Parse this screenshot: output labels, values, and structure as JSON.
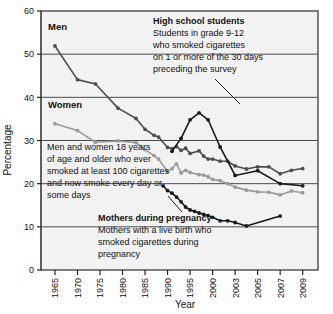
{
  "chart_data": {
    "type": "line",
    "title": "",
    "xlabel": "Year",
    "ylabel": "Percentage",
    "ylim": [
      0,
      60
    ],
    "yticks": [
      0,
      10,
      20,
      30,
      40,
      50,
      60
    ],
    "ytick_labels": [
      "0",
      "10",
      "20",
      "30",
      "40",
      "50",
      "60"
    ],
    "grid": "horizontal",
    "legend": "inline-annotations",
    "xtick_labels": [
      "1965",
      "1970",
      "1975",
      "1980",
      "1985",
      "1990",
      "1995",
      "2000",
      "2003",
      "2005",
      "2007",
      "2009"
    ],
    "xtick_values": [
      1965,
      1970,
      1975,
      1980,
      1985,
      1990,
      1995,
      2000,
      2003,
      2005,
      2007,
      2009
    ],
    "x_axis_note": "Tick spacing is uneven after 2000: 2000, 2003, 2005, 2007, 2009 are evenly spaced slots",
    "series": [
      {
        "name": "Men",
        "color": "#4d4d4d",
        "marker": "circle",
        "x": [
          1965,
          1970,
          1974,
          1979,
          1983,
          1985,
          1987,
          1988,
          1990,
          1991,
          1992,
          1993,
          1994,
          1995,
          1997,
          1998,
          1999,
          2000,
          2001,
          2002,
          2003,
          2004,
          2005,
          2006,
          2007,
          2008,
          2009
        ],
        "values": [
          51.9,
          44.1,
          43.1,
          37.5,
          35.1,
          32.6,
          31.2,
          30.8,
          28.4,
          28.1,
          28.6,
          27.7,
          28.2,
          27.0,
          27.6,
          26.4,
          25.7,
          25.7,
          25.2,
          25.2,
          24.1,
          23.4,
          23.9,
          23.9,
          22.3,
          23.1,
          23.5
        ]
      },
      {
        "name": "Women",
        "color": "#9a9a9a",
        "marker": "circle",
        "x": [
          1965,
          1970,
          1974,
          1979,
          1983,
          1985,
          1987,
          1988,
          1990,
          1991,
          1992,
          1993,
          1994,
          1995,
          1997,
          1998,
          1999,
          2000,
          2001,
          2002,
          2003,
          2004,
          2005,
          2006,
          2007,
          2008,
          2009
        ],
        "values": [
          33.9,
          32.3,
          29.6,
          29.9,
          29.5,
          27.9,
          26.5,
          25.7,
          22.8,
          23.5,
          24.6,
          22.5,
          23.1,
          22.6,
          22.1,
          22.0,
          21.6,
          21.0,
          20.7,
          20.0,
          19.2,
          18.5,
          18.1,
          18.0,
          17.4,
          18.3,
          17.9
        ]
      },
      {
        "name": "High school students",
        "color": "#1a1a1a",
        "marker": "circle",
        "x": [
          1991,
          1993,
          1995,
          1997,
          1999,
          2001,
          2003,
          2005,
          2007,
          2009
        ],
        "values": [
          27.5,
          30.5,
          34.8,
          36.4,
          34.8,
          28.5,
          21.9,
          23.0,
          20.0,
          19.5
        ]
      },
      {
        "name": "Mothers during pregnancy",
        "color": "#1a1a1a",
        "marker": "circle",
        "x": [
          1989,
          1990,
          1991,
          1992,
          1993,
          1994,
          1995,
          1996,
          1997,
          1998,
          1999,
          2000,
          2001,
          2002,
          2003,
          2004,
          2007
        ],
        "values": [
          19.5,
          18.4,
          17.8,
          16.9,
          15.8,
          14.6,
          13.9,
          13.6,
          13.2,
          12.9,
          12.6,
          12.2,
          11.4,
          11.4,
          11.0,
          10.2,
          12.5
        ]
      }
    ],
    "annotations": [
      {
        "id": "men-label",
        "text": "Men",
        "bold": true
      },
      {
        "id": "women-label",
        "text": "Women",
        "bold": true
      },
      {
        "id": "highschool-annotation",
        "heading": "High school students",
        "lines": [
          "Students in grade 9-12",
          "who smoked cigarettes",
          "on 1 or more of the 30 days",
          "preceding the survey"
        ]
      },
      {
        "id": "adults-annotation",
        "heading": "",
        "lines": [
          "Men and women 18 years",
          "of age and older who ever",
          "smoked at  least 100 cigarettes",
          "and now smoke every day or",
          "some days"
        ]
      },
      {
        "id": "mothers-annotation",
        "heading": "Mothers during pregnancy",
        "lines": [
          "Mothers with a live birth who",
          "smoked cigarettes during",
          "pregnancy"
        ]
      }
    ]
  },
  "labels": {
    "men": "Men",
    "women": "Women",
    "hs_head": "High school students",
    "hs_l1": "Students in grade 9-12",
    "hs_l2": "who smoked cigarettes",
    "hs_l3": "on 1 or more of the 30 days",
    "hs_l4": "preceding the survey",
    "ad_l1": "Men and women 18 years",
    "ad_l2": "of age and older who ever",
    "ad_l3": "smoked at  least 100 cigarettes",
    "ad_l4": "and now smoke every day or",
    "ad_l5": "some days",
    "mo_head": "Mothers during pregnancy",
    "mo_l1": "Mothers with a live birth who",
    "mo_l2": "smoked cigarettes during",
    "mo_l3": "pregnancy",
    "xlabel": "Year",
    "ylabel": "Percentage",
    "y0": "0",
    "y10": "10",
    "y20": "20",
    "y30": "30",
    "y40": "40",
    "y50": "50",
    "y60": "60",
    "x1965": "1965",
    "x1970": "1970",
    "x1975": "1975",
    "x1980": "1980",
    "x1985": "1985",
    "x1990": "1990",
    "x1995": "1995",
    "x2000": "2000",
    "x2003": "2003",
    "x2005": "2005",
    "x2007": "2007",
    "x2009": "2009"
  },
  "colors": {
    "plot_bg": "#f2f2f2",
    "frame": "#555555",
    "grid": "#4a4a4a",
    "men": "#4d4d4d",
    "women": "#9a9a9a",
    "dark": "#1a1a1a"
  }
}
